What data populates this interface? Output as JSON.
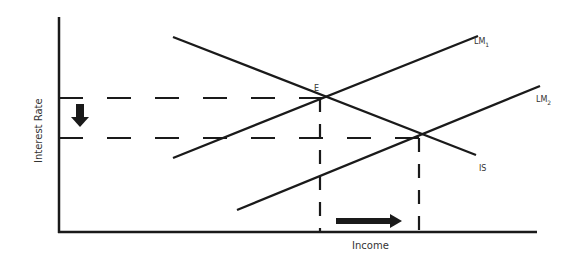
{
  "diagram": {
    "axes": {
      "x_label": "Income",
      "y_label": "Interest Rate"
    },
    "curves": [
      {
        "id": "IS",
        "label": "IS",
        "sub": ""
      },
      {
        "id": "LM1",
        "label": "LM",
        "sub": "1"
      },
      {
        "id": "LM2",
        "label": "LM",
        "sub": "2"
      }
    ],
    "points": [
      {
        "id": "E",
        "label": "E"
      }
    ],
    "annotations": {
      "interest_rate_arrow": "down",
      "income_arrow": "right"
    },
    "colors": {
      "line": "#1a1a1a",
      "background": "#ffffff"
    }
  }
}
